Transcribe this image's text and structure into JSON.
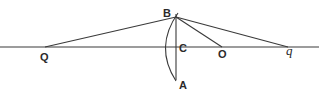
{
  "diagram": {
    "type": "geometric-optics",
    "stroke_color": "#3a3a3a",
    "points": {
      "Q": {
        "label": "Q",
        "x": 45,
        "y": 47
      },
      "B": {
        "label": "B",
        "x": 176,
        "y": 17
      },
      "C": {
        "label": "C",
        "x": 176,
        "y": 47
      },
      "O": {
        "label": "O",
        "x": 222,
        "y": 47
      },
      "q": {
        "label": "q",
        "x": 288,
        "y": 47
      },
      "A": {
        "label": "A",
        "x": 176,
        "y": 80
      }
    },
    "segments": [
      {
        "from": "axis-left",
        "to": "axis-right",
        "name": "principal-axis"
      },
      {
        "from": "Q",
        "to": "B",
        "name": "incident-ray"
      },
      {
        "from": "B",
        "to": "O",
        "name": "radius-BO"
      },
      {
        "from": "B",
        "to": "q",
        "name": "refracted-ray"
      },
      {
        "from": "B",
        "to": "A",
        "name": "chord-BA"
      }
    ],
    "arcs": [
      {
        "from": "B",
        "to": "A",
        "name": "surface-arc"
      }
    ]
  }
}
